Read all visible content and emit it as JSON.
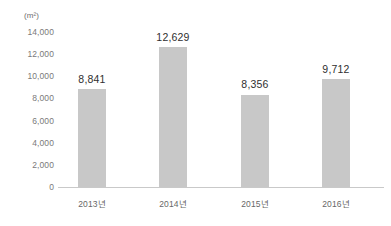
{
  "chart_data": {
    "type": "bar",
    "title": "",
    "subtitle": "",
    "unit_label": "(m²)",
    "xlabel": "",
    "ylabel": "",
    "categories": [
      "2013년",
      "2014년",
      "2015년",
      "2016년"
    ],
    "values": [
      8841,
      12629,
      8356,
      9712
    ],
    "value_labels": [
      "8,841",
      "12,629",
      "8,356",
      "9,712"
    ],
    "ylim": [
      0,
      14000
    ],
    "ytick_values": [
      0,
      2000,
      4000,
      6000,
      8000,
      10000,
      12000,
      14000
    ],
    "ytick_labels": [
      "0",
      "2,000",
      "4,000",
      "6,000",
      "8,000",
      "10,000",
      "12,000",
      "14,000"
    ],
    "grid": false,
    "legend": "none",
    "series": [
      {
        "name": "",
        "values": [
          8841,
          12629,
          8356,
          9712
        ]
      }
    ],
    "colors": {
      "bar": "#c8c8c8",
      "axis_line": "#c9c9c9",
      "tick_text": "#7a7a7a",
      "value_text": "#2f2f2f",
      "category_text": "#676767",
      "background": "#ffffff"
    }
  }
}
